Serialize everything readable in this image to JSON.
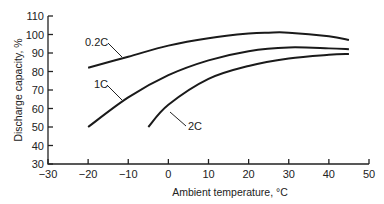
{
  "chart_data": {
    "type": "line",
    "title": "",
    "xlabel": "Ambient temperature, °C",
    "ylabel": "Discharge capacity, %",
    "xlim": [
      -30,
      50
    ],
    "ylim": [
      30,
      110
    ],
    "xticks": [
      -30,
      -20,
      -10,
      0,
      10,
      20,
      30,
      40,
      50
    ],
    "yticks": [
      30,
      40,
      50,
      60,
      70,
      80,
      90,
      100,
      110
    ],
    "grid": false,
    "legend": "inline labels",
    "series": [
      {
        "name": "0.2C",
        "x": [
          -20,
          -10,
          0,
          10,
          20,
          25,
          30,
          40,
          45
        ],
        "y": [
          82,
          88,
          94,
          98,
          100.5,
          101,
          101,
          99,
          97
        ]
      },
      {
        "name": "1C",
        "x": [
          -20,
          -10,
          0,
          10,
          20,
          30,
          40,
          45
        ],
        "y": [
          50,
          66,
          78,
          86,
          91,
          93,
          92.5,
          92
        ]
      },
      {
        "name": "2C",
        "x": [
          -5,
          0,
          10,
          20,
          30,
          40,
          45
        ],
        "y": [
          50,
          62,
          76,
          83,
          87,
          89,
          89.5
        ]
      }
    ]
  },
  "labels": {
    "xlabel": "Ambient temperature, °C",
    "ylabel": "Discharge capacity, %",
    "curve_0": "0.2C",
    "curve_1": "1C",
    "curve_2": "2C"
  }
}
